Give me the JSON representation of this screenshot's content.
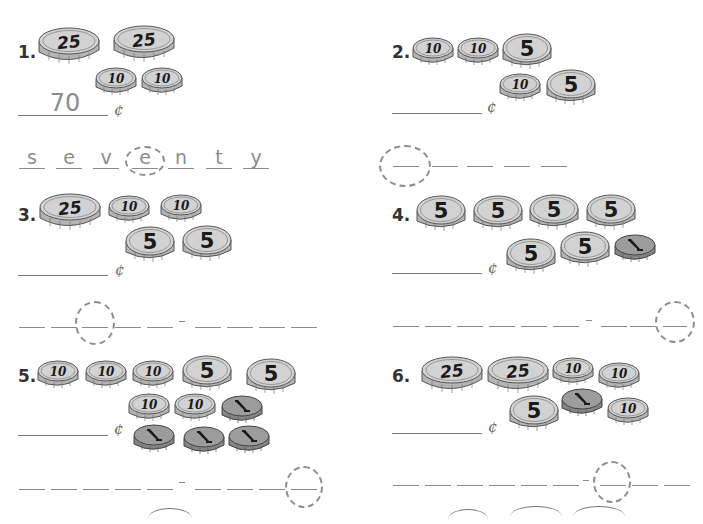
{
  "worksheet": {
    "cent_symbol": "¢",
    "colors": {
      "coin_face": "#d2d2d2",
      "coin_edge": "#b4b4b4",
      "penny_face": "#9c9c9c",
      "penny_edge": "#858585",
      "line": "#8a8a8a",
      "answer_text": "#8c8c8c"
    },
    "problems": [
      {
        "number_label": "1.",
        "coins_rows": [
          [
            "25",
            "25"
          ],
          [
            "10",
            "10"
          ]
        ],
        "answer_value": "70",
        "word_letters": [
          "s",
          "e",
          "v",
          "e",
          "n",
          "t",
          "y"
        ],
        "word_pattern": "7 blanks",
        "circled_index": 4
      },
      {
        "number_label": "2.",
        "coins_rows": [
          [
            "10",
            "10",
            "5"
          ],
          [
            "10",
            "5"
          ]
        ],
        "answer_value": "",
        "word_letters": [
          "",
          "",
          "",
          "",
          ""
        ],
        "word_pattern": "5 blanks",
        "circled_index": 1
      },
      {
        "number_label": "3.",
        "coins_rows": [
          [
            "25",
            "10",
            "10"
          ],
          [
            "5",
            "5"
          ]
        ],
        "answer_value": "",
        "word_letters": [
          "",
          "",
          "",
          "",
          "",
          "",
          "",
          ""
        ],
        "word_pattern": "4 blanks - 4 blanks",
        "circled_index": 3
      },
      {
        "number_label": "4.",
        "coins_rows": [
          [
            "5",
            "5",
            "5",
            "5"
          ],
          [
            "5",
            "5",
            "1"
          ]
        ],
        "answer_value": "",
        "word_letters": [
          "",
          "",
          "",
          "",
          "",
          "",
          "",
          "",
          ""
        ],
        "word_pattern": "6 blanks - 3 blanks",
        "circled_index": 9
      },
      {
        "number_label": "5.",
        "coins_rows": [
          [
            "10",
            "10",
            "10",
            "5",
            "5"
          ],
          [
            "10",
            "10",
            "1"
          ],
          [
            "1",
            "1",
            "1"
          ]
        ],
        "answer_value": "",
        "word_letters": [
          "",
          "",
          "",
          "",
          "",
          "",
          "",
          "",
          ""
        ],
        "word_pattern": "5 blanks - 4 blanks",
        "circled_index": 9
      },
      {
        "number_label": "6.",
        "coins_rows": [
          [
            "25",
            "25",
            "10",
            "10"
          ],
          [
            "5",
            "1",
            "10"
          ]
        ],
        "answer_value": "",
        "word_letters": [
          "",
          "",
          "",
          "",
          "",
          "",
          "",
          "",
          "",
          ""
        ],
        "word_pattern": "6 blanks - 4 blanks",
        "circled_index": 7
      }
    ]
  }
}
